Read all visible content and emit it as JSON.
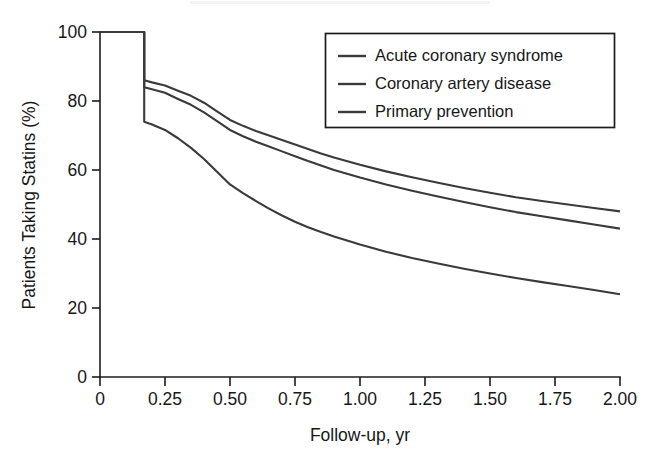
{
  "chart_data": {
    "type": "line",
    "title": "",
    "subtitle": "",
    "xlabel": "Follow-up, yr",
    "ylabel": "Patients Taking Statins (%)",
    "xlim": [
      0,
      2.0
    ],
    "ylim": [
      0,
      100
    ],
    "grid": false,
    "legend_position": "top-right",
    "xticks": [
      0,
      0.25,
      0.5,
      0.75,
      1.0,
      1.25,
      1.5,
      1.75,
      2.0
    ],
    "xtick_labels": [
      "0",
      "0.25",
      "0.50",
      "0.75",
      "1.00",
      "1.25",
      "1.50",
      "1.75",
      "2.00"
    ],
    "yticks": [
      0,
      20,
      40,
      60,
      80,
      100
    ],
    "ytick_labels": [
      "0",
      "20",
      "40",
      "60",
      "80",
      "100"
    ],
    "line_color": "#3a3a3a",
    "axis_color": "#1c1c1c",
    "background": "#ffffff",
    "x": [
      0.0,
      0.17,
      0.17,
      0.2,
      0.25,
      0.3,
      0.35,
      0.4,
      0.45,
      0.5,
      0.55,
      0.6,
      0.65,
      0.7,
      0.75,
      0.8,
      0.85,
      0.9,
      1.0,
      1.1,
      1.2,
      1.3,
      1.4,
      1.5,
      1.6,
      1.7,
      1.8,
      1.9,
      2.0
    ],
    "series": [
      {
        "name": "Acute coronary syndrome",
        "color": "#3a3a3a",
        "values": [
          100,
          100,
          86,
          85.4,
          84.5,
          83.0,
          81.5,
          79.5,
          77.0,
          74.5,
          72.8,
          71.3,
          70.0,
          68.7,
          67.4,
          66.1,
          64.8,
          63.6,
          61.5,
          59.6,
          57.9,
          56.3,
          54.8,
          53.4,
          52.1,
          51.0,
          50.0,
          49.0,
          48.0
        ]
      },
      {
        "name": "Coronary artery disease",
        "color": "#3a3a3a",
        "values": [
          100,
          100,
          84,
          83.4,
          82.4,
          80.6,
          78.9,
          76.7,
          74.2,
          71.6,
          69.8,
          68.2,
          66.8,
          65.4,
          64.0,
          62.6,
          61.3,
          60.0,
          57.8,
          55.8,
          54.0,
          52.3,
          50.7,
          49.2,
          47.8,
          46.6,
          45.4,
          44.2,
          43.0
        ]
      },
      {
        "name": "Primary prevention",
        "color": "#3a3a3a",
        "values": [
          100,
          100,
          74,
          73.2,
          71.6,
          69.2,
          66.4,
          63.2,
          59.5,
          55.8,
          53.3,
          51.0,
          48.8,
          46.8,
          45.0,
          43.4,
          42.0,
          40.7,
          38.4,
          36.3,
          34.5,
          32.9,
          31.4,
          30.0,
          28.7,
          27.5,
          26.4,
          25.2,
          24.0
        ]
      }
    ],
    "annotations": [],
    "drop_time_yr": 0.17
  },
  "legend": {
    "entries": [
      {
        "label": "Acute coronary syndrome"
      },
      {
        "label": "Coronary artery disease"
      },
      {
        "label": "Primary prevention"
      }
    ]
  }
}
